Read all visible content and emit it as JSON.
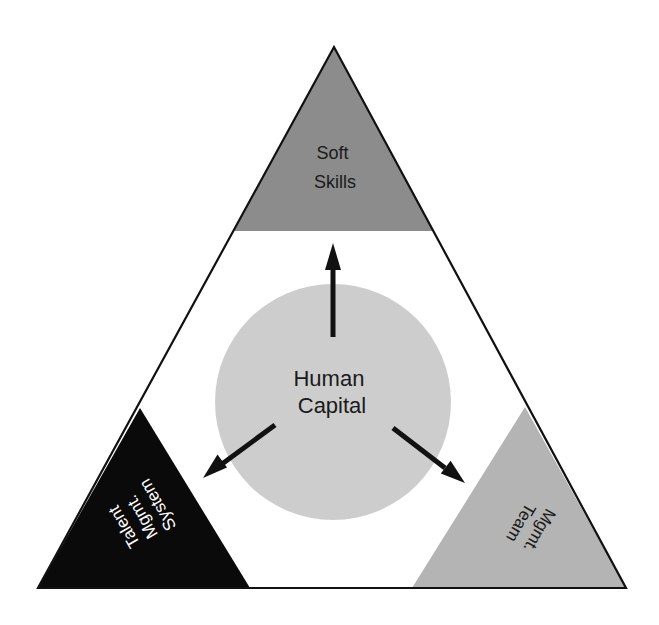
{
  "diagram": {
    "type": "triangle-hub-diagram",
    "center": {
      "label_lines": [
        "Human",
        "Capital"
      ],
      "color": "#cdcdcd"
    },
    "corners": {
      "top": {
        "label_lines": [
          "Soft",
          "Skills"
        ],
        "color": "#8c8c8c",
        "text_color": "#1a1a1a"
      },
      "bottom_left": {
        "label_lines": [
          "Talent",
          "Mgmt.",
          "System"
        ],
        "color": "#0a0a0a",
        "text_color": "#ffffff"
      },
      "bottom_right": {
        "label_lines": [
          "Mgmt.",
          "Team"
        ],
        "color": "#b4b4b4",
        "text_color": "#1a1a1a"
      }
    },
    "arrows": [
      {
        "from": "center",
        "to": "top"
      },
      {
        "from": "center",
        "to": "bottom_left"
      },
      {
        "from": "center",
        "to": "bottom_right"
      }
    ],
    "outline_color": "#111111",
    "background": "#ffffff"
  }
}
